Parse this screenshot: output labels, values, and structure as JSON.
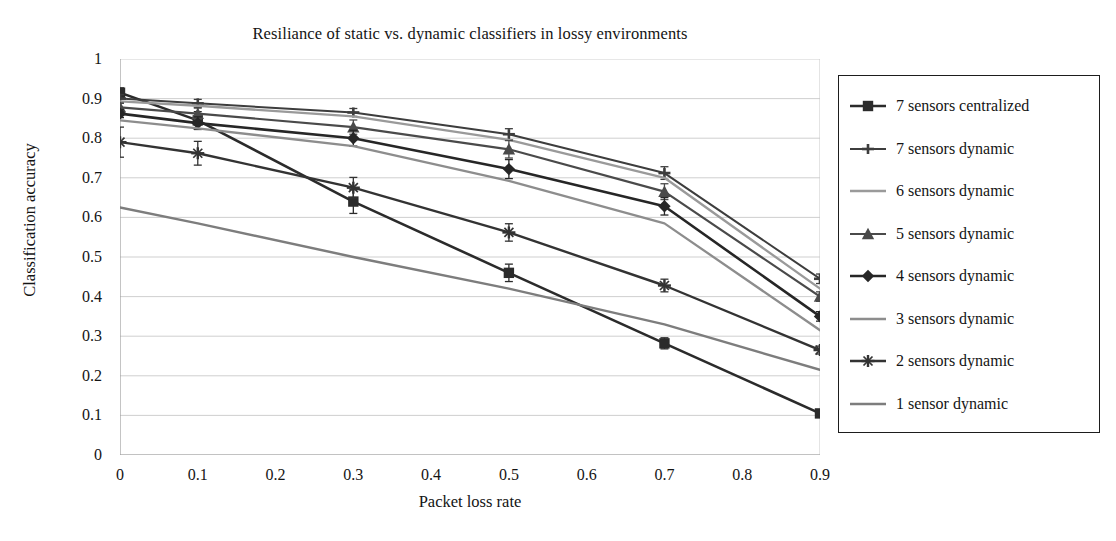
{
  "chart_data": {
    "type": "line",
    "title": "Resiliance of static vs. dynamic classifiers in lossy environments",
    "xlabel": "Packet loss rate",
    "ylabel": "Classification accuracy",
    "xlim": [
      0,
      0.9
    ],
    "ylim": [
      0,
      1
    ],
    "xticks": [
      "0",
      "0.1",
      "0.2",
      "0.3",
      "0.4",
      "0.5",
      "0.6",
      "0.7",
      "0.8",
      "0.9"
    ],
    "xtick_values": [
      0,
      0.1,
      0.2,
      0.3,
      0.4,
      0.5,
      0.6,
      0.7,
      0.8,
      0.9
    ],
    "yticks": [
      "0",
      "0.1",
      "0.2",
      "0.3",
      "0.4",
      "0.5",
      "0.6",
      "0.7",
      "0.8",
      "0.9",
      "1"
    ],
    "ytick_values": [
      0,
      0.1,
      0.2,
      0.3,
      0.4,
      0.5,
      0.6,
      0.7,
      0.8,
      0.9,
      1
    ],
    "grid": "horizontal",
    "legend_position": "right-outside",
    "error_bars": true,
    "x": [
      0,
      0.1,
      0.3,
      0.5,
      0.7,
      0.9
    ],
    "series": [
      {
        "name": "7 sensors centralized",
        "marker": "square",
        "color": "#2b2b2b",
        "width": 2.6,
        "values": [
          0.915,
          0.845,
          0.64,
          0.46,
          0.282,
          0.105
        ],
        "err": [
          0.012,
          0.022,
          0.03,
          0.022,
          0.014,
          0.008
        ]
      },
      {
        "name": "7 sensors dynamic",
        "marker": "plus",
        "color": "#3d3d3d",
        "width": 2.0,
        "values": [
          0.9,
          0.888,
          0.865,
          0.81,
          0.712,
          0.445
        ],
        "err": [
          0.01,
          0.01,
          0.01,
          0.014,
          0.016,
          0.012
        ]
      },
      {
        "name": "6 sensors dynamic",
        "marker": "none",
        "color": "#9a9a9a",
        "width": 2.3,
        "values": [
          0.893,
          0.882,
          0.855,
          0.796,
          0.7,
          0.42
        ],
        "err": [
          0,
          0,
          0,
          0,
          0,
          0
        ]
      },
      {
        "name": "5 sensors dynamic",
        "marker": "triangle",
        "color": "#4a4a4a",
        "width": 2.2,
        "values": [
          0.878,
          0.862,
          0.828,
          0.772,
          0.665,
          0.4
        ],
        "err": [
          0.01,
          0.014,
          0.018,
          0.022,
          0.02,
          0.012
        ]
      },
      {
        "name": "4 sensors dynamic",
        "marker": "diamond",
        "color": "#262626",
        "width": 2.6,
        "values": [
          0.862,
          0.838,
          0.8,
          0.722,
          0.628,
          0.35
        ],
        "err": [
          0.01,
          0.016,
          0.02,
          0.024,
          0.022,
          0.012
        ]
      },
      {
        "name": "3 sensors dynamic",
        "marker": "none",
        "color": "#8d8d8d",
        "width": 2.3,
        "values": [
          0.845,
          0.825,
          0.78,
          0.692,
          0.585,
          0.315
        ],
        "err": [
          0,
          0,
          0,
          0,
          0,
          0
        ]
      },
      {
        "name": "2 sensors dynamic",
        "marker": "star",
        "color": "#333333",
        "width": 2.4,
        "values": [
          0.79,
          0.762,
          0.675,
          0.562,
          0.428,
          0.265
        ],
        "err": [
          0.038,
          0.03,
          0.026,
          0.022,
          0.016,
          0.01
        ]
      },
      {
        "name": "1 sensor dynamic",
        "marker": "none",
        "color": "#7d7d7d",
        "width": 2.4,
        "values": [
          0.625,
          0.585,
          0.5,
          0.42,
          0.33,
          0.215
        ],
        "err": [
          0,
          0,
          0,
          0,
          0,
          0
        ]
      }
    ]
  },
  "legend": {
    "items": [
      {
        "label": "7 sensors centralized"
      },
      {
        "label": "7 sensors dynamic"
      },
      {
        "label": "6 sensors dynamic"
      },
      {
        "label": "5 sensors dynamic"
      },
      {
        "label": "4 sensors dynamic"
      },
      {
        "label": "3 sensors dynamic"
      },
      {
        "label": "2 sensors dynamic"
      },
      {
        "label": "1 sensor dynamic"
      }
    ]
  }
}
